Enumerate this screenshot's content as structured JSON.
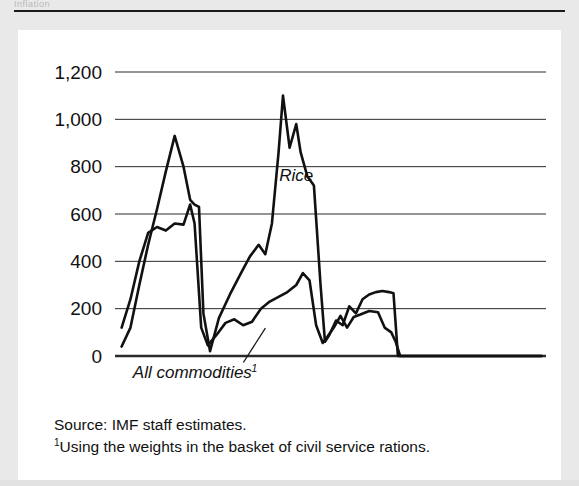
{
  "scan": {
    "top_clipped_text": "Inflation",
    "background_color": "#e9e9e9",
    "card_color": "#ffffff",
    "ink_color": "#111111"
  },
  "notes": {
    "source": "Source: IMF staff estimates.",
    "footnote_marker": "1",
    "footnote": "Using the weights in the basket of civil service rations."
  },
  "chart_data": {
    "type": "line",
    "title": "",
    "subtitle": "",
    "xlabel": "",
    "ylabel": "",
    "xlim": [
      1975.5,
      1995.0
    ],
    "ylim": [
      -200,
      1200
    ],
    "grid": true,
    "gridlines_y": [
      0,
      200,
      400,
      600,
      800,
      1000,
      1200
    ],
    "legend_position": "inline-annotations",
    "y_tick_labels": [
      "1,200",
      "1,000",
      "800",
      "600",
      "400",
      "200",
      "0",
      "−200"
    ],
    "y_tick_values": [
      1200,
      1000,
      800,
      600,
      400,
      200,
      0,
      -200
    ],
    "x_tick_labels": [
      "1976",
      "1978",
      "1980",
      "1982",
      "1984",
      "1986",
      "1988",
      "1990",
      "1992",
      "1994"
    ],
    "x_tick_values": [
      1976,
      1978,
      1980,
      1982,
      1984,
      1986,
      1988,
      1990,
      1992,
      1994
    ],
    "x_minor_tick_step": 0.5,
    "annotations": [
      {
        "text": "Rice",
        "x": 1983.7,
        "y": 740
      },
      {
        "text": "All commodities",
        "superscript": "1",
        "x": 1979.0,
        "y": -95
      }
    ],
    "series": [
      {
        "name": "Rice",
        "color": "#111111",
        "x": [
          1975.8,
          1976.2,
          1976.6,
          1977.0,
          1977.4,
          1977.8,
          1978.2,
          1978.6,
          1978.9,
          1979.1,
          1979.3,
          1979.5,
          1979.8,
          1980.2,
          1980.7,
          1981.2,
          1981.6,
          1982.0,
          1982.3,
          1982.6,
          1982.9,
          1983.1,
          1983.4,
          1983.7,
          1983.9,
          1984.2,
          1984.5,
          1984.8,
          1985.0,
          1985.2,
          1985.5,
          1985.8,
          1986.1,
          1986.4,
          1986.7,
          1987.0,
          1987.3,
          1987.6,
          1987.9,
          1988.1,
          1988.3,
          1988.6,
          1989.0,
          1990.0,
          1991.0,
          1992.0,
          1993.0,
          1994.0,
          1994.8
        ],
        "y": [
          40,
          120,
          300,
          470,
          620,
          780,
          930,
          800,
          660,
          640,
          630,
          180,
          20,
          160,
          260,
          350,
          420,
          470,
          430,
          560,
          860,
          1100,
          880,
          980,
          860,
          760,
          720,
          300,
          60,
          90,
          150,
          130,
          210,
          180,
          240,
          260,
          270,
          275,
          270,
          265,
          0,
          0,
          0,
          0,
          0,
          0,
          0,
          0,
          0
        ]
      },
      {
        "name": "All commodities",
        "color": "#111111",
        "x": [
          1975.8,
          1976.2,
          1976.6,
          1977.0,
          1977.4,
          1977.8,
          1978.2,
          1978.6,
          1978.9,
          1979.1,
          1979.4,
          1979.7,
          1980.1,
          1980.5,
          1980.9,
          1981.3,
          1981.7,
          1982.1,
          1982.5,
          1982.9,
          1983.3,
          1983.7,
          1984.0,
          1984.3,
          1984.6,
          1984.9,
          1985.1,
          1985.4,
          1985.7,
          1986.0,
          1986.3,
          1986.6,
          1987.0,
          1987.4,
          1987.7,
          1988.0,
          1988.2,
          1988.4,
          1988.7,
          1989.0,
          1990.0,
          1991.0,
          1992.0,
          1993.0,
          1994.0,
          1994.8
        ],
        "y": [
          120,
          240,
          400,
          520,
          545,
          530,
          560,
          555,
          640,
          560,
          120,
          45,
          90,
          140,
          155,
          130,
          145,
          200,
          230,
          250,
          270,
          300,
          350,
          320,
          130,
          55,
          80,
          120,
          170,
          120,
          165,
          175,
          190,
          185,
          120,
          100,
          60,
          0,
          0,
          0,
          0,
          0,
          0,
          0,
          0,
          0
        ]
      }
    ]
  }
}
